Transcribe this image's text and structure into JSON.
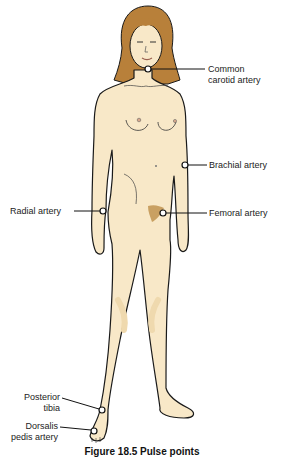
{
  "figure": {
    "title": "Pulse points",
    "caption": "Figure 18.5 Pulse points",
    "colors": {
      "skin": "#f8e8c8",
      "skin_shadow": "#efd9ae",
      "hair": "#b8803a",
      "outline": "#1a1a1a",
      "pubic": "#c9a062",
      "background": "#ffffff"
    }
  },
  "labels": [
    {
      "id": "common-carotid",
      "line1": "Common",
      "line2": "carotid artery"
    },
    {
      "id": "brachial",
      "line1": "Brachial artery"
    },
    {
      "id": "radial",
      "line1": "Radial artery"
    },
    {
      "id": "femoral",
      "line1": "Femoral artery"
    },
    {
      "id": "posterior-tibia",
      "line1": "Posterior",
      "line2": "tibia"
    },
    {
      "id": "dorsalis-pedis",
      "line1": "Dorsalis",
      "line2": "pedis artery"
    }
  ]
}
